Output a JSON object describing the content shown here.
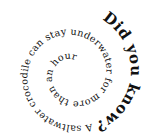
{
  "spiral": {
    "heading": "Did you know?",
    "body": " A saltwater crocodile can stay underwater for more than an hour.",
    "text_color": "#111111",
    "background": "#ffffff"
  }
}
